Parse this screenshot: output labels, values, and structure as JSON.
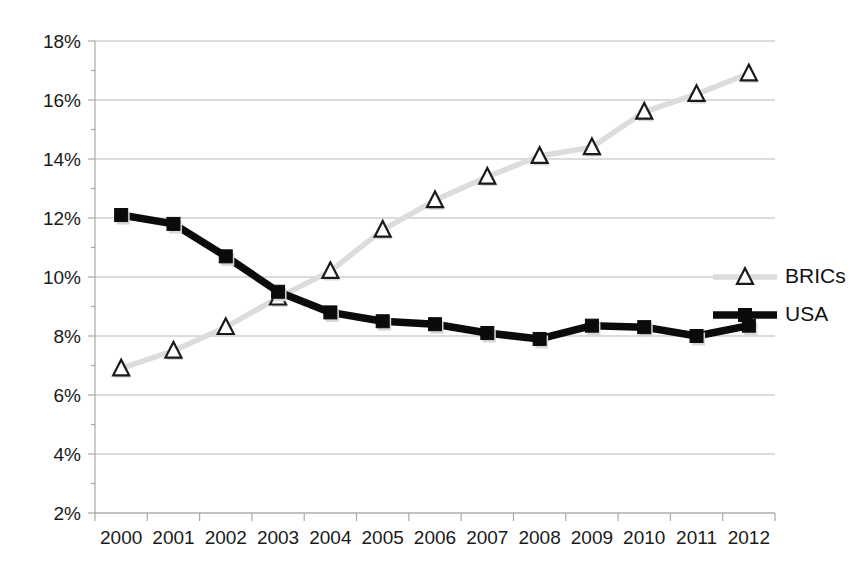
{
  "chart_data": {
    "type": "line",
    "title": "",
    "subtitle": "",
    "xlabel": "",
    "ylabel": "",
    "categories": [
      "2000",
      "2001",
      "2002",
      "2003",
      "2004",
      "2005",
      "2006",
      "2007",
      "2008",
      "2009",
      "2010",
      "2011",
      "2012"
    ],
    "x": [
      2000,
      2001,
      2002,
      2003,
      2004,
      2005,
      2006,
      2007,
      2008,
      2009,
      2010,
      2011,
      2012
    ],
    "series": [
      {
        "name": "BRICs",
        "marker": "triangle-open",
        "color": "#dcdcdc",
        "marker_color": "#1a1a1a",
        "values": [
          6.9,
          7.5,
          8.3,
          9.3,
          10.2,
          11.6,
          12.6,
          13.4,
          14.1,
          14.4,
          15.6,
          16.2,
          16.9
        ]
      },
      {
        "name": "USA",
        "marker": "square-filled",
        "color": "#0b0b0b",
        "marker_color": "#0b0b0b",
        "values": [
          12.1,
          11.8,
          10.7,
          9.5,
          8.8,
          8.5,
          8.4,
          8.1,
          7.9,
          8.35,
          8.3,
          8.0,
          8.35
        ]
      }
    ],
    "ylim": [
      2,
      18
    ],
    "ytick_step": 2,
    "ytick_labels": [
      "2%",
      "4%",
      "6%",
      "8%",
      "10%",
      "12%",
      "14%",
      "16%",
      "18%"
    ],
    "ytick_values": [
      2,
      4,
      6,
      8,
      10,
      12,
      14,
      16,
      18
    ],
    "xtick_labels": [
      "2000",
      "2001",
      "2002",
      "2003",
      "2004",
      "2005",
      "2006",
      "2007",
      "2008",
      "2009",
      "2010",
      "2011",
      "2012"
    ],
    "grid": {
      "horizontal": true,
      "vertical": false,
      "color": "#b9b9b9"
    },
    "legend": {
      "position": "right-inside",
      "entries": [
        {
          "label": "BRICs",
          "marker": "triangle-open",
          "line_color": "#dcdcdc"
        },
        {
          "label": "USA",
          "marker": "square-filled",
          "line_color": "#0b0b0b"
        }
      ]
    },
    "axis_color": "#a8a8a8",
    "background": "#ffffff"
  }
}
